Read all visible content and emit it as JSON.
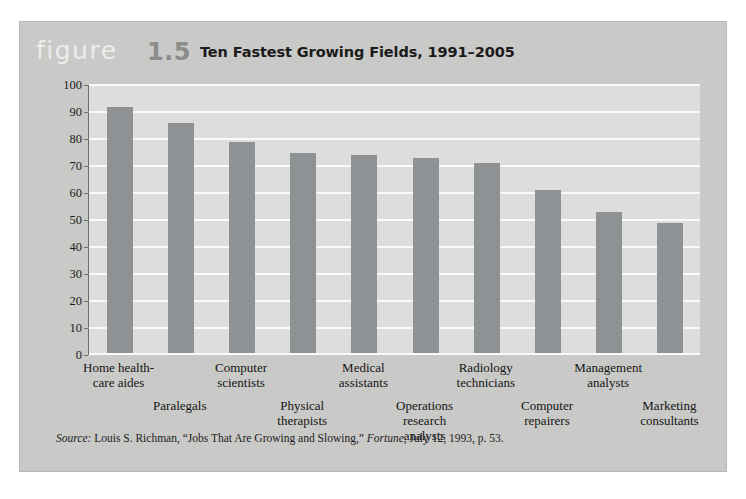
{
  "figure": {
    "word": "figure",
    "number": "1.5",
    "title": "Ten Fastest Growing Fields, 1991–2005"
  },
  "source": {
    "prefix": "Source:",
    "text_1": " Louis S. Richman, “Jobs That Are Growing and Slowing,” ",
    "publication": "Fortune",
    "text_2": ", July 12, 1993, p. 53."
  },
  "colors": {
    "card_background": "#c9c9c7",
    "plot_background": "#dddddb",
    "bar": "#8e9294",
    "gridline": "#fafaf8",
    "axis": "#6f6f6d",
    "figure_word": "#ececeb",
    "figure_number": "#8b8b89",
    "text": "#1c1c1c"
  },
  "chart_data": {
    "type": "bar",
    "title": "Ten Fastest Growing Fields, 1991–2005",
    "xlabel": "",
    "ylabel": "Percent growth in number of jobs",
    "ylim": [
      0,
      100
    ],
    "yticks": [
      0,
      10,
      20,
      30,
      40,
      50,
      60,
      70,
      80,
      90,
      100
    ],
    "grid": true,
    "legend": "none",
    "categories": [
      "Home health-care aides",
      "Paralegals",
      "Computer scientists",
      "Physical therapists",
      "Medical assistants",
      "Operations research analysts",
      "Radiology technicians",
      "Computer repairers",
      "Management analysts",
      "Marketing consultants"
    ],
    "category_lines": [
      [
        "Home health-",
        "care aides"
      ],
      [
        "Paralegals"
      ],
      [
        "Computer",
        "scientists"
      ],
      [
        "Physical",
        "therapists"
      ],
      [
        "Medical",
        "assistants"
      ],
      [
        "Operations",
        "research",
        "analysts"
      ],
      [
        "Radiology",
        "technicians"
      ],
      [
        "Computer",
        "repairers"
      ],
      [
        "Management",
        "analysts"
      ],
      [
        "Marketing",
        "consultants"
      ]
    ],
    "values": [
      92,
      86,
      79,
      75,
      74,
      73,
      71,
      61,
      53,
      49
    ]
  }
}
